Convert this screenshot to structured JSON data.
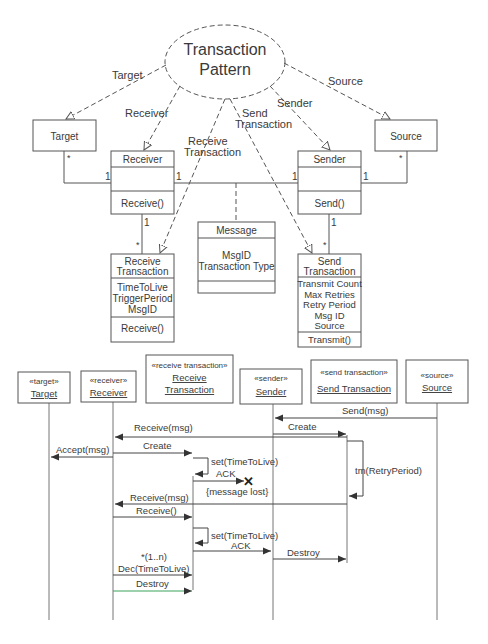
{
  "class_diagram": {
    "pattern": {
      "line1": "Transaction",
      "line2": "Pattern"
    },
    "roles": {
      "target": "Target",
      "receiver": "Receiver",
      "receive_transaction_1": "Receive",
      "receive_transaction_2": "Transaction",
      "send_transaction_1": "Send",
      "send_transaction_2": "Transaction",
      "sender": "Sender",
      "source": "Source"
    },
    "classes": {
      "target": {
        "name": "Target"
      },
      "source": {
        "name": "Source"
      },
      "receiver": {
        "name": "Receiver",
        "operation": "Receive()"
      },
      "sender": {
        "name": "Sender",
        "operation": "Send()"
      },
      "message": {
        "name": "Message",
        "attributes": [
          "MsgID",
          "Transaction Type"
        ]
      },
      "receive_transaction": {
        "name_line1": "Receive",
        "name_line2": "Transaction",
        "attributes": [
          "TimeToLive",
          "TriggerPeriod",
          "MsgID"
        ],
        "operation": "Receive()"
      },
      "send_transaction": {
        "name_line1": "Send",
        "name_line2": "Transaction",
        "attributes": [
          "Transmit Count",
          "Max Retries",
          "Retry Period",
          "Msg ID",
          "Source"
        ],
        "operation": "Transmit()"
      }
    },
    "multiplicities": {
      "target_star": "*",
      "receiver_left": "1",
      "receiver_right": "1",
      "sender_left": "1",
      "sender_right": "1",
      "source_star": "*",
      "receiver_bottom": "1",
      "receive_tx_star": "*",
      "sender_bottom": "1",
      "send_tx_star": "*"
    }
  },
  "sequence_diagram": {
    "lifelines": [
      {
        "stereotype": "«target»",
        "name": "Target"
      },
      {
        "stereotype": "«receiver»",
        "name": "Receiver"
      },
      {
        "stereotype": "«receive transaction»",
        "name_line1": "Receive",
        "name_line2": "Transaction"
      },
      {
        "stereotype": "«sender»",
        "name": "Sender"
      },
      {
        "stereotype": "«send transaction»",
        "name": "Send Transaction"
      },
      {
        "stereotype": "«source»",
        "name": "Source"
      }
    ],
    "messages": {
      "send_msg": "Send(msg)",
      "create_send": "Create",
      "receive_msg_1": "Receive(msg)",
      "accept_msg": "Accept(msg)",
      "create_receive": "Create",
      "set_ttl_1": "set(TimeToLive)",
      "ack_1": "ACK",
      "message_lost": "{message lost}",
      "tm_retry": "tm(RetryPeriod)",
      "receive_msg_2": "Receive(msg)",
      "receive_call": "Receive()",
      "set_ttl_2": "set(TimeToLive)",
      "ack_2": "ACK",
      "destroy_send": "Destroy",
      "multiplicity": "*(1..n)",
      "dec_ttl": "Dec(TimeToLive)",
      "destroy_receive": "Destroy"
    }
  }
}
